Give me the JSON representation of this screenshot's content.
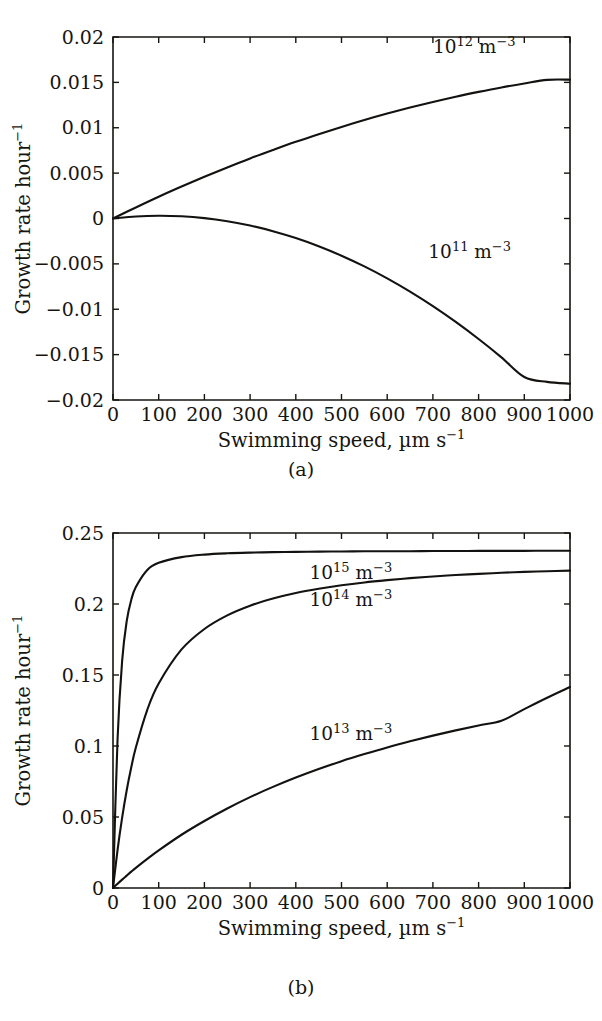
{
  "figure": {
    "panel_a_caption": "(a)",
    "panel_b_caption": "(b)",
    "line_color": "#141210",
    "background_color": "#ffffff"
  },
  "chart_data": [
    {
      "id": "panel-a",
      "type": "line",
      "title": "",
      "panel_label": "(a)",
      "xlabel": "Swimming speed, µm s⁻¹",
      "ylabel": "Growth rate hour⁻¹",
      "xlim": [
        0,
        1000
      ],
      "ylim": [
        -0.02,
        0.02
      ],
      "grid": false,
      "legend": "inline-annotations",
      "xticks": [
        0,
        100,
        200,
        300,
        400,
        500,
        600,
        700,
        800,
        900,
        1000
      ],
      "xtick_labels": [
        "0",
        "100",
        "200",
        "300",
        "400",
        "500",
        "600",
        "700",
        "800",
        "900",
        "1000"
      ],
      "yticks": [
        0.02,
        0.015,
        0.01,
        0.005,
        0,
        -0.005,
        -0.01,
        -0.015,
        -0.02
      ],
      "ytick_labels": [
        "0.02",
        "0.015",
        "0.01",
        "0.005",
        "0",
        "−0.005",
        "−0.01",
        "−0.015",
        "−0.02"
      ],
      "x": [
        0,
        50,
        100,
        150,
        200,
        250,
        300,
        350,
        400,
        450,
        500,
        550,
        600,
        650,
        700,
        750,
        800,
        850,
        900,
        950,
        1000
      ],
      "series": [
        {
          "name": "10¹² m⁻³",
          "label_mantissa": "10",
          "label_exponent": "12",
          "label_unit": " m",
          "label_unit_exponent": "−3",
          "label_x": 700,
          "label_y": 0.0182,
          "values": [
            0.0,
            0.00122,
            0.0024,
            0.00352,
            0.0046,
            0.00563,
            0.00662,
            0.00755,
            0.00845,
            0.00929,
            0.01009,
            0.01085,
            0.01156,
            0.01222,
            0.01284,
            0.01342,
            0.01395,
            0.01444,
            0.01488,
            0.01528,
            0.0153
          ]
        },
        {
          "name": "10¹¹ m⁻³",
          "label_mantissa": "10",
          "label_exponent": "11",
          "label_unit": " m",
          "label_unit_exponent": "−3",
          "label_x": 690,
          "label_y": -0.0044,
          "values": [
            0.0,
            0.00022,
            0.0003,
            0.00024,
            4e-05,
            -0.0003,
            -0.00078,
            -0.0014,
            -0.00216,
            -0.00306,
            -0.0041,
            -0.00528,
            -0.0066,
            -0.00806,
            -0.00966,
            -0.0114,
            -0.01328,
            -0.0153,
            -0.01746,
            -0.018,
            -0.0182
          ]
        }
      ]
    },
    {
      "id": "panel-b",
      "type": "line",
      "title": "",
      "panel_label": "(b)",
      "xlabel": "Swimming speed, µm s⁻¹",
      "ylabel": "Growth rate hour⁻¹",
      "xlim": [
        0,
        1000
      ],
      "ylim": [
        0,
        0.25
      ],
      "grid": false,
      "legend": "inline-annotations",
      "xticks": [
        0,
        100,
        200,
        300,
        400,
        500,
        600,
        700,
        800,
        900,
        1000
      ],
      "xtick_labels": [
        "0",
        "100",
        "200",
        "300",
        "400",
        "500",
        "600",
        "700",
        "800",
        "900",
        "1000"
      ],
      "yticks": [
        0.25,
        0.2,
        0.15,
        0.1,
        0.05,
        0
      ],
      "ytick_labels": [
        "0.25",
        "0.2",
        "0.15",
        "0.1",
        "0.05",
        "0"
      ],
      "x": [
        0,
        10,
        20,
        30,
        40,
        50,
        75,
        100,
        150,
        200,
        250,
        300,
        350,
        400,
        450,
        500,
        550,
        600,
        650,
        700,
        750,
        800,
        850,
        900,
        950,
        1000
      ],
      "series": [
        {
          "name": "10¹⁵ m⁻³",
          "label_mantissa": "10",
          "label_exponent": "15",
          "label_unit": " m",
          "label_unit_exponent": "−3",
          "label_x": 430,
          "label_y": 0.2175,
          "values": [
            0.0,
            0.105,
            0.16,
            0.188,
            0.203,
            0.212,
            0.224,
            0.229,
            0.233,
            0.2348,
            0.2357,
            0.2362,
            0.2365,
            0.2367,
            0.2369,
            0.237,
            0.2371,
            0.2372,
            0.2372,
            0.2373,
            0.2373,
            0.2374,
            0.2374,
            0.2374,
            0.2375,
            0.2375
          ]
        },
        {
          "name": "10¹⁴ m⁻³",
          "label_mantissa": "10",
          "label_exponent": "14",
          "label_unit": " m",
          "label_unit_exponent": "−3",
          "label_x": 430,
          "label_y": 0.1985,
          "values": [
            0.0,
            0.0268,
            0.0495,
            0.0688,
            0.085,
            0.099,
            0.1255,
            0.144,
            0.168,
            0.1824,
            0.192,
            0.1988,
            0.2038,
            0.2077,
            0.2107,
            0.2132,
            0.2152,
            0.2168,
            0.2182,
            0.2194,
            0.2204,
            0.2212,
            0.222,
            0.2226,
            0.2231,
            0.2235
          ]
        },
        {
          "name": "10¹³ m⁻³",
          "label_mantissa": "10",
          "label_exponent": "13",
          "label_unit": " m",
          "label_unit_exponent": "−3",
          "label_x": 430,
          "label_y": 0.1045,
          "values": [
            0.0,
            0.003,
            0.0059,
            0.0087,
            0.0115,
            0.0142,
            0.0205,
            0.0265,
            0.0375,
            0.0472,
            0.056,
            0.064,
            0.0712,
            0.0778,
            0.0838,
            0.0893,
            0.0943,
            0.099,
            0.1033,
            0.1073,
            0.111,
            0.1145,
            0.1178,
            0.126,
            0.134,
            0.1415
          ]
        }
      ]
    }
  ]
}
